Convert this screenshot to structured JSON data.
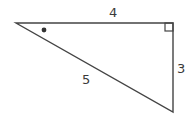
{
  "diagram": {
    "type": "right-triangle",
    "vertices": {
      "left": [
        16,
        23
      ],
      "right_angle": [
        173,
        23
      ],
      "bottom": [
        173,
        112
      ]
    },
    "sides": {
      "top": {
        "label": "4"
      },
      "right": {
        "label": "3"
      },
      "hypotenuse": {
        "label": "5"
      }
    },
    "markers": {
      "right_angle": "square at top-right vertex",
      "angle_dot": "dot marking angle at left vertex"
    },
    "colors": {
      "stroke": "#444444",
      "text": "#3a3a3a"
    }
  }
}
